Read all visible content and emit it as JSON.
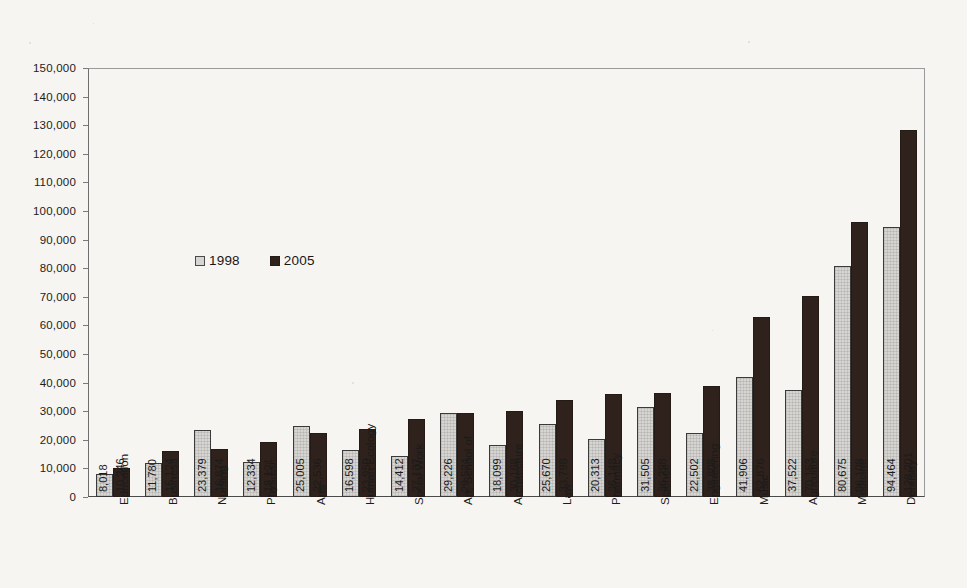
{
  "chart_data": {
    "type": "bar",
    "title": "",
    "xlabel": "",
    "ylabel": "",
    "ylim": [
      0,
      150000
    ],
    "ytick_step": 10000,
    "grid": false,
    "legend_position": "inside-upper-left",
    "categories": [
      "Education",
      "Business",
      "Nursing",
      "Phys.Ed.",
      "Arts",
      "Human Ecology",
      "Social Work",
      "Art, School of",
      "Architecture",
      "Law",
      "Pharmacy",
      "Science",
      "Engineering",
      "Music",
      "Agriculture",
      "Medicine",
      "Dentistry"
    ],
    "series": [
      {
        "name": "1998",
        "color": "#d6d5d2",
        "values": [
          8018,
          11780,
          23379,
          12334,
          25005,
          16598,
          14412,
          29226,
          18099,
          25670,
          20313,
          31505,
          22502,
          41906,
          37522,
          80675,
          94464
        ],
        "labels": [
          "8,018",
          "11,780",
          "23,379",
          "12,334",
          "25,005",
          "16,598",
          "14,412",
          "29,226",
          "18,099",
          "25,670",
          "20,313",
          "31,505",
          "22,502",
          "41,906",
          "37,522",
          "80,675",
          "94,464"
        ]
      },
      {
        "name": "2005",
        "color": "#2f221c",
        "values": [
          10246,
          16124,
          16874,
          19121,
          22536,
          23950,
          27137,
          29524,
          30168,
          33798,
          36148,
          36298,
          38808,
          62876,
          70153,
          96108,
          128201
        ],
        "labels": [
          "10,246",
          "16,124",
          "16,874",
          "19,121",
          "22,536",
          "23,950",
          "27,137",
          "29,524",
          "30,168",
          "33,798",
          "36,148",
          "36,298",
          "38,808",
          "62,876",
          "70,153",
          "96,108",
          "128,201"
        ]
      }
    ],
    "ytick_labels": [
      "0",
      "10,000",
      "20,000",
      "30,000",
      "40,000",
      "50,000",
      "60,000",
      "70,000",
      "80,000",
      "90,000",
      "100,000",
      "110,000",
      "120,000",
      "130,000",
      "140,000",
      "150,000"
    ]
  },
  "legend": {
    "items": [
      {
        "label": "1998",
        "swatch": "light-gray"
      },
      {
        "label": "2005",
        "swatch": "black"
      }
    ]
  }
}
